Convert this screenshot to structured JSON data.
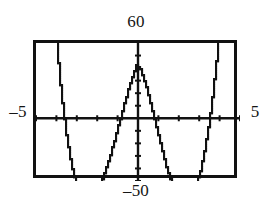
{
  "graph": {
    "labels": {
      "ymax": "60",
      "ymin": "–50",
      "xmin": "–5",
      "xmax": "5"
    },
    "colors": {
      "frame": "#111111",
      "axis": "#111111",
      "curve": "#111111",
      "background": "#ffffff"
    }
  },
  "chart_data": {
    "type": "line",
    "title": "",
    "xlabel": "",
    "ylabel": "",
    "xlim": [
      -5,
      5
    ],
    "ylim": [
      -50,
      60
    ],
    "grid": false,
    "legend": null,
    "axis_ticks": {
      "x_tick_interval": 1,
      "x_ticks": [
        -5,
        -4,
        -3,
        -2,
        -1,
        1,
        2,
        3,
        4,
        5
      ],
      "y_tick_interval": 10,
      "y_ticks": [
        -50,
        -40,
        -30,
        -20,
        -10,
        10,
        20,
        30,
        40,
        50
      ]
    },
    "annotations": [
      "x-axis window minimum labeled –5 at left of frame",
      "x-axis window maximum labeled 5 at right of frame",
      "y-axis window maximum labeled 60 above frame",
      "y-axis window minimum labeled –50 below frame"
    ],
    "features": {
      "shape": "quartic W-curve with two minima and one local maximum",
      "local_maximum": {
        "x": 0,
        "y": 44
      },
      "local_minima": [
        {
          "x": -2.7,
          "y": -34
        },
        {
          "x": 2.7,
          "y": -34
        }
      ],
      "x_intercepts": [
        -3.9,
        -1.47,
        1.62,
        3.9
      ]
    },
    "series": [
      {
        "name": "y",
        "x": [
          -5.0,
          -4.85,
          -4.7,
          -4.55,
          -4.4,
          -4.25,
          -4.1,
          -3.95,
          -3.8,
          -3.65,
          -3.5,
          -3.35,
          -3.2,
          -3.05,
          -2.9,
          -2.75,
          -2.6,
          -2.45,
          -2.3,
          -2.15,
          -2.0,
          -1.85,
          -1.7,
          -1.55,
          -1.4,
          -1.25,
          -1.1,
          -0.95,
          -0.8,
          -0.65,
          -0.5,
          -0.35,
          -0.2,
          -0.05,
          0.1,
          0.25,
          0.4,
          0.55,
          0.7,
          0.85,
          1.0,
          1.15,
          1.3,
          1.45,
          1.6,
          1.75,
          1.9,
          2.05,
          2.2,
          2.35,
          2.5,
          2.65,
          2.8,
          2.95,
          3.1,
          3.25,
          3.4,
          3.55,
          3.7,
          3.85,
          4.0,
          4.15,
          4.3,
          4.45,
          4.6,
          4.75,
          4.9,
          5.0
        ],
        "y": [
          352.0,
          297.0,
          247.0,
          201.0,
          159.0,
          121.0,
          87.0,
          57.0,
          31.0,
          8.0,
          -11.0,
          -27.0,
          -40.0,
          -50.0,
          -57.0,
          -62.0,
          -65.0,
          -66.0,
          -65.0,
          -63.0,
          -59.0,
          -54.0,
          -48.0,
          -41.0,
          -33.0,
          -25.0,
          -16.0,
          -7.0,
          2.0,
          11.0,
          20.0,
          28.0,
          36.0,
          42.0,
          41.0,
          35.0,
          27.0,
          18.0,
          8.0,
          -2.0,
          -12.0,
          -22.0,
          -31.0,
          -40.0,
          -47.0,
          -54.0,
          -59.0,
          -63.0,
          -66.0,
          -66.0,
          -65.0,
          -62.0,
          -57.0,
          -50.0,
          -41.0,
          -29.0,
          -15.0,
          1.0,
          20.0,
          42.0,
          67.0,
          95.0,
          127.0,
          163.0,
          203.0,
          247.0,
          296.0,
          352.0
        ]
      }
    ]
  }
}
